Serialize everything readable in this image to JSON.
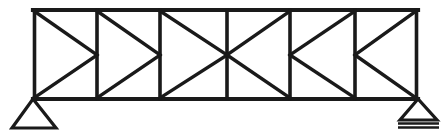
{
  "figure": {
    "type": "structural-truss-diagram",
    "background_color": "#ffffff",
    "line_color": "#1a1a1a",
    "width": 447,
    "height": 135
  },
  "geometry": {
    "top_chord": {
      "y": 10,
      "x_start": 33,
      "x_end": 418,
      "label": "top chord"
    },
    "bottom_chord": {
      "y": 99,
      "x_start": 33,
      "x_end": 418,
      "label": "bottom chord"
    },
    "panel_count": 6,
    "mid_height_y": 55,
    "vertical_x_positions": [
      33,
      97,
      160,
      227,
      290,
      355,
      418
    ],
    "panel_widths": [
      64,
      63,
      67,
      63,
      65,
      63
    ]
  },
  "members": {
    "verticals": [
      {
        "name": "vertical-1-left-end",
        "x": 33
      },
      {
        "name": "vertical-2",
        "x": 97
      },
      {
        "name": "vertical-3",
        "x": 160
      },
      {
        "name": "vertical-4-center",
        "x": 227
      },
      {
        "name": "vertical-5",
        "x": 290
      },
      {
        "name": "vertical-6",
        "x": 355
      },
      {
        "name": "vertical-7-right-end",
        "x": 418
      }
    ],
    "diagonals": [
      {
        "name": "diagonal-panel1-upper",
        "x1": 33,
        "y1": 10,
        "x2": 97,
        "y2": 55
      },
      {
        "name": "diagonal-panel1-lower",
        "x1": 97,
        "y1": 55,
        "x2": 33,
        "y2": 99
      },
      {
        "name": "diagonal-panel2-upper",
        "x1": 97,
        "y1": 10,
        "x2": 160,
        "y2": 55
      },
      {
        "name": "diagonal-panel2-lower",
        "x1": 160,
        "y1": 55,
        "x2": 97,
        "y2": 99
      },
      {
        "name": "diagonal-panel3-upper",
        "x1": 160,
        "y1": 10,
        "x2": 227,
        "y2": 55
      },
      {
        "name": "diagonal-panel3-lower",
        "x1": 227,
        "y1": 55,
        "x2": 160,
        "y2": 99
      },
      {
        "name": "diagonal-panel4-upper",
        "x1": 290,
        "y1": 10,
        "x2": 227,
        "y2": 55
      },
      {
        "name": "diagonal-panel4-lower",
        "x1": 227,
        "y1": 55,
        "x2": 290,
        "y2": 99
      },
      {
        "name": "diagonal-panel5-upper",
        "x1": 355,
        "y1": 10,
        "x2": 290,
        "y2": 55
      },
      {
        "name": "diagonal-panel5-lower",
        "x1": 290,
        "y1": 55,
        "x2": 355,
        "y2": 99
      },
      {
        "name": "diagonal-panel6-upper",
        "x1": 418,
        "y1": 10,
        "x2": 355,
        "y2": 55
      },
      {
        "name": "diagonal-panel6-lower",
        "x1": 355,
        "y1": 55,
        "x2": 418,
        "y2": 99
      }
    ]
  },
  "supports": {
    "left": {
      "kind": "pin",
      "label": "pinned support",
      "node_x": 33,
      "node_y": 99,
      "triangle": "33,99 12,128 56,128",
      "has_base_lines": false
    },
    "right": {
      "kind": "roller",
      "label": "roller support",
      "node_x": 418,
      "node_y": 99,
      "triangle": "418,99 400,120 437,120",
      "has_base_lines": true,
      "base_lines": [
        {
          "y": 123,
          "x_start": 398,
          "x_end": 439
        },
        {
          "y": 127,
          "x_start": 398,
          "x_end": 439
        }
      ]
    }
  },
  "accessibility": {
    "description": "Line drawing of a six-panel simply supported truss with parallel top and bottom chords, seven vertical web members, and twelve diagonal web members meeting at mid-height. A pinned triangular support sits under the left end node and a roller support with two base lines sits under the right end node."
  }
}
